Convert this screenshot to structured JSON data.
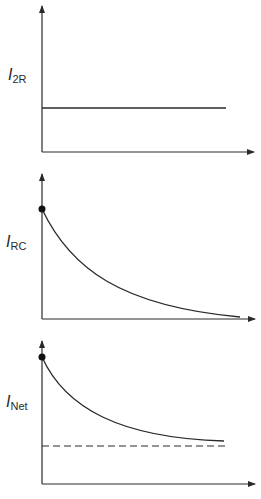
{
  "colors": {
    "line": "#2a2a2a",
    "background": "#ffffff"
  },
  "panels": [
    {
      "id": "i2r",
      "label_main": "I",
      "label_sub": "2R",
      "curve": "constant",
      "description": "Constant current"
    },
    {
      "id": "irc",
      "label_main": "I",
      "label_sub": "RC",
      "curve": "exponential-decay-to-zero",
      "description": "Exponentially decaying current starting at a maximum"
    },
    {
      "id": "inet",
      "label_main": "I",
      "label_sub": "Net",
      "curve": "exponential-decay-to-asymptote",
      "description": "Decaying current approaching a dashed asymptote"
    }
  ]
}
